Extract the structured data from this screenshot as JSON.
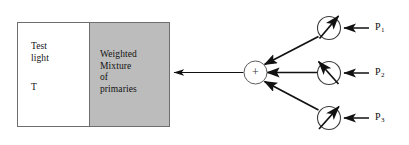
{
  "figure": {
    "type": "color-matching-apparatus-diagram",
    "background_color": "#ffffff",
    "line_color": "#111111",
    "thin_line_color": "#6e6e6e",
    "panel_gray": "#bcbcbc"
  },
  "stimulus_box": {
    "left_half": {
      "label": "Test\nlight",
      "symbol": "T",
      "fill": "#ffffff"
    },
    "right_half": {
      "label": "Weighted\nMixture\nof\nprimaries",
      "fill": "#bcbcbc"
    }
  },
  "summing_node": {
    "symbol": "+"
  },
  "primaries": [
    {
      "id": "p1",
      "label": "P",
      "subscript": "1"
    },
    {
      "id": "p2",
      "label": "P",
      "subscript": "2"
    },
    {
      "id": "p3",
      "label": "P",
      "subscript": "3"
    }
  ],
  "attenuator_symbol": "variable-gain-circle-with-diagonal-arrow"
}
